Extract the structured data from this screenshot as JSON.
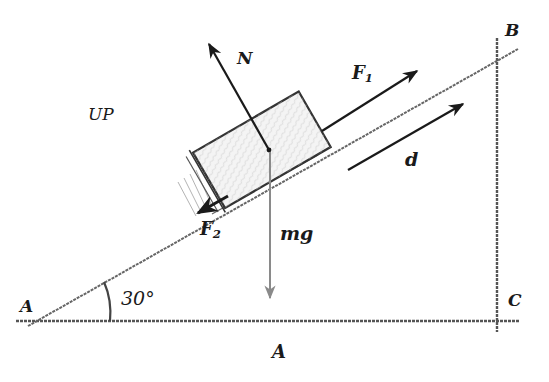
{
  "diagram": {
    "type": "free-body-diagram-inclined-plane",
    "labels": {
      "vertex_A": "A",
      "vertex_B": "B",
      "vertex_C": "C",
      "angle": "30°",
      "region": "UP",
      "bottom_caption": "A",
      "normal_force": "N",
      "applied_force": "F",
      "applied_force_sub": "1",
      "friction_force": "F",
      "friction_force_sub": "2",
      "weight": "mg",
      "displacement": "d"
    },
    "colors": {
      "line": "#1a1a1a",
      "incline_sketch": "#555555",
      "weight_arrow": "#8a8a8a",
      "block_fill": "#f4f4f4",
      "background": "#ffffff"
    },
    "geometry": {
      "incline_angle_deg": 30
    }
  }
}
